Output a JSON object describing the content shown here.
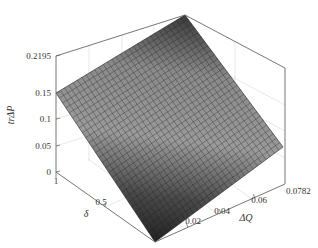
{
  "chart_data": {
    "type": "surface3d",
    "title": "",
    "xlabel": "ΔQ",
    "ylabel": "δ",
    "zlabel": "trΔP",
    "x_ticks": [
      "0",
      "0.02",
      "0.04",
      "0.06",
      "0.0782"
    ],
    "y_ticks": [
      "0",
      "0.5",
      "1"
    ],
    "z_ticks": [
      "0",
      "0.05",
      "0.1",
      "0.15",
      "0.2195"
    ],
    "xlim": [
      0,
      0.0782
    ],
    "ylim": [
      0,
      1
    ],
    "zlim": [
      0,
      0.2195
    ],
    "surface_corners": [
      {
        "dQ": 0,
        "delta": 0,
        "z": 0
      },
      {
        "dQ": 0,
        "delta": 1,
        "z": 0.15
      },
      {
        "dQ": 0.0782,
        "delta": 1,
        "z": 0.2195
      },
      {
        "dQ": 0.0782,
        "delta": 0,
        "z": 0.07
      }
    ],
    "grid": true,
    "colormap": "gray",
    "mesh": "30x30"
  },
  "labels": {
    "zlabel": "trΔP",
    "ylabel": "δ",
    "xlabel": "ΔQ",
    "z_ticks": [
      "0",
      "0.05",
      "0.1",
      "0.15",
      "0.2195"
    ],
    "y_tick_1": "1",
    "y_tick_05": "0.5",
    "y_tick_0": "0",
    "x_tick_0": "0",
    "x_tick_002": "0.02",
    "x_tick_004": "0.04",
    "x_tick_006": "0.06",
    "x_tick_max": "0.0782"
  }
}
